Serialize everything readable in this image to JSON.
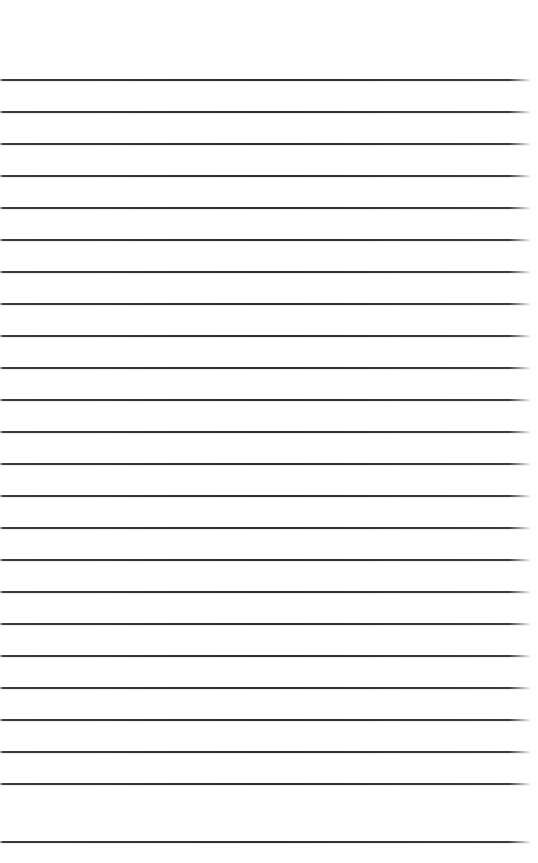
{
  "page": {
    "kind": "lined-notebook-page-scan",
    "width_px": 538,
    "height_px": 863,
    "background_color": "#ffffff",
    "paper_color": "#ffffff",
    "content_text": "",
    "has_visible_text": false,
    "has_handwriting": false
  },
  "rules": {
    "label": "ruled lines",
    "count": 24,
    "line_color": "#2e2e2e",
    "line_color_faded_right": "#d8d8d8",
    "line_thickness_px": 2,
    "spacing_px": 32,
    "first_line_y_px": 79,
    "line_start_x_px": 0,
    "line_end_x_px": 530,
    "line_length_px": 530,
    "y_positions": [
      79,
      111,
      143,
      175,
      207,
      239,
      271,
      303,
      335,
      367,
      399,
      431,
      463,
      495,
      527,
      559,
      591,
      623,
      655,
      687,
      719,
      751,
      783,
      841
    ]
  },
  "margins": {
    "top_blank_px": 79,
    "bottom_blank_px": 21,
    "right_blank_px": 8,
    "left_blank_px": 0
  }
}
